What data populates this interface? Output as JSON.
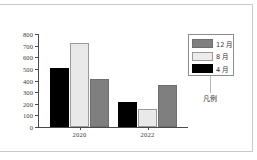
{
  "figure": {
    "caption": "凡例",
    "legend_title_note": "凡例"
  },
  "legend": {
    "position": "right",
    "entries": [
      {
        "label": "12 月",
        "swatch": "gray",
        "color": "#7f7f7f"
      },
      {
        "label": "8 月",
        "swatch": "white",
        "color": "#ececec"
      },
      {
        "label": "4 月",
        "swatch": "black",
        "color": "#000000"
      }
    ]
  },
  "axis": {
    "y_ticks": [
      "800",
      "700",
      "600",
      "500",
      "400",
      "300",
      "200",
      "100",
      "0"
    ],
    "x_ticks": [
      "2020",
      "2022"
    ]
  },
  "chart_data": {
    "type": "bar",
    "title": "",
    "subtitle": "",
    "xlabel": "",
    "ylabel": "",
    "categories": [
      "2020",
      "2022"
    ],
    "series": [
      {
        "name": "4 月",
        "color": "#000000",
        "values": [
          505,
          215
        ]
      },
      {
        "name": "8 月",
        "color": "#ececec",
        "values": [
          720,
          155
        ]
      },
      {
        "name": "12 月",
        "color": "#7f7f7f",
        "values": [
          410,
          360
        ]
      }
    ],
    "ylim": [
      0,
      800
    ],
    "ytick_step": 100,
    "grid": false,
    "legend_position": "right",
    "annotations": [
      "凡例"
    ]
  },
  "colors": {
    "bar_black": "#000000",
    "bar_white": "#ececec",
    "bar_gray": "#7f7f7f",
    "axis": "#4a4a4a",
    "frame": "#c9c9c9"
  }
}
